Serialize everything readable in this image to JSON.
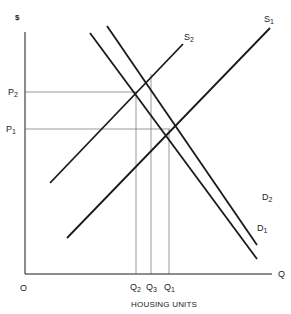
{
  "diagram": {
    "title": "",
    "y_axis_label": "$",
    "x_axis_label": "Q",
    "x_axis_title": "HOUSING UNITS",
    "origin_label": "O",
    "price_levels": [
      {
        "base": "P",
        "sub": "2"
      },
      {
        "base": "P",
        "sub": "1"
      }
    ],
    "quantity_levels": [
      {
        "base": "Q",
        "sub": "2"
      },
      {
        "base": "Q",
        "sub": "3"
      },
      {
        "base": "Q",
        "sub": "1"
      }
    ],
    "curves": [
      {
        "name": "S1",
        "base": "S",
        "sub": "1",
        "type": "supply"
      },
      {
        "name": "S2",
        "base": "S",
        "sub": "2",
        "type": "supply"
      },
      {
        "name": "D1",
        "base": "D",
        "sub": "1",
        "type": "demand"
      },
      {
        "name": "D2",
        "base": "D",
        "sub": "2",
        "type": "demand"
      }
    ],
    "line_color": "#1a1a1a",
    "guide_color": "#555555"
  }
}
